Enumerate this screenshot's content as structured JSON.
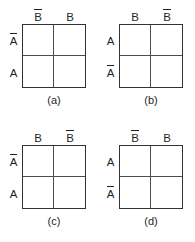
{
  "figures": [
    {
      "caption": "(a)",
      "cols": [
        {
          "text": "B",
          "bar": true
        },
        {
          "text": "B",
          "bar": false
        }
      ],
      "rows": [
        {
          "text": "A",
          "bar": true
        },
        {
          "text": "A",
          "bar": false
        }
      ]
    },
    {
      "caption": "(b)",
      "cols": [
        {
          "text": "B",
          "bar": false
        },
        {
          "text": "B",
          "bar": true
        }
      ],
      "rows": [
        {
          "text": "A",
          "bar": false
        },
        {
          "text": "A",
          "bar": true
        }
      ]
    },
    {
      "caption": "(c)",
      "cols": [
        {
          "text": "B",
          "bar": false
        },
        {
          "text": "B",
          "bar": true
        }
      ],
      "rows": [
        {
          "text": "A",
          "bar": true
        },
        {
          "text": "A",
          "bar": false
        }
      ]
    },
    {
      "caption": "(d)",
      "cols": [
        {
          "text": "B",
          "bar": true
        },
        {
          "text": "B",
          "bar": false
        }
      ],
      "rows": [
        {
          "text": "A",
          "bar": false
        },
        {
          "text": "A",
          "bar": true
        }
      ]
    }
  ],
  "colors": {
    "line": "#333333",
    "inner_line": "#4d4d4d",
    "text": "#1f1f1f",
    "background": "#ffffff"
  }
}
